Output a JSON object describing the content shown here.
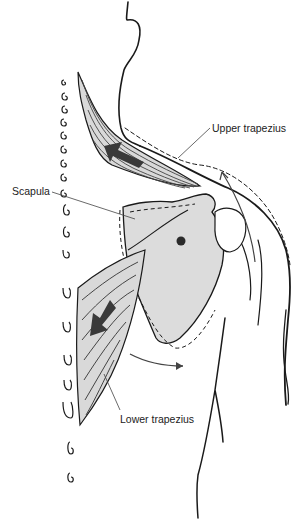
{
  "diagram": {
    "labels": {
      "upper_trapezius": "Upper trapezius",
      "scapula": "Scapula",
      "lower_trapezius": "Lower trapezius"
    },
    "arrows": [
      {
        "name": "upper-trapezius-pull",
        "direction": "up-left (medial/superior)"
      },
      {
        "name": "lower-trapezius-pull",
        "direction": "down-left (medial/inferior)"
      },
      {
        "name": "acromion-rotation",
        "direction": "upward along shoulder arc"
      },
      {
        "name": "inferior-angle-rotation",
        "direction": "lateral (right)"
      }
    ],
    "colors": {
      "line": "#1a1a1a",
      "muscle_fill": "#d9d9d9",
      "scapula_fill": "#dcdcdc",
      "arrow_fill": "#3a3a3a",
      "label_text": "#222222"
    }
  }
}
